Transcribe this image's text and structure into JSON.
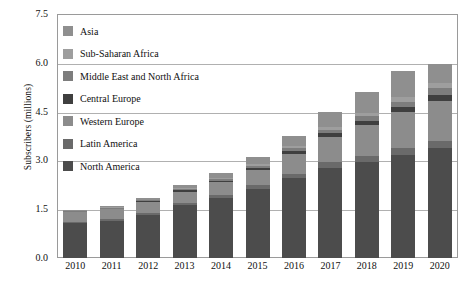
{
  "chart_data": {
    "type": "bar",
    "subtype": "stacked-bar",
    "title": "",
    "xlabel": "",
    "ylabel": "Subscribers (millions)",
    "ylim": [
      0.0,
      7.5
    ],
    "yticks": [
      "0.0",
      "1.5",
      "3.0",
      "4.5",
      "6.0",
      "7.5"
    ],
    "ytick_values": [
      0.0,
      1.5,
      3.0,
      4.5,
      6.0,
      7.5
    ],
    "grid": true,
    "grid_axis": "y",
    "legend_position": "upper-left-inside",
    "categories": [
      "2010",
      "2011",
      "2012",
      "2013",
      "2014",
      "2015",
      "2016",
      "2017",
      "2018",
      "2019",
      "2020"
    ],
    "series": [
      {
        "name": "North America",
        "color": "#4c4c4c",
        "values": [
          1.08,
          1.15,
          1.33,
          1.62,
          1.85,
          2.12,
          2.45,
          2.78,
          2.95,
          3.18,
          3.38
        ]
      },
      {
        "name": "Latin America",
        "color": "#6a6a6a",
        "values": [
          0.04,
          0.05,
          0.06,
          0.08,
          0.1,
          0.12,
          0.14,
          0.16,
          0.18,
          0.2,
          0.22
        ]
      },
      {
        "name": "Western Europe",
        "color": "#8c8c8c",
        "values": [
          0.28,
          0.3,
          0.32,
          0.34,
          0.38,
          0.46,
          0.6,
          0.78,
          0.95,
          1.1,
          1.24
        ]
      },
      {
        "name": "Central Europe",
        "color": "#3f3f3f",
        "values": [
          0.02,
          0.02,
          0.03,
          0.04,
          0.05,
          0.07,
          0.09,
          0.11,
          0.13,
          0.15,
          0.17
        ]
      },
      {
        "name": "Middle East and North Africa",
        "color": "#7d7d7d",
        "values": [
          0.02,
          0.02,
          0.03,
          0.04,
          0.05,
          0.07,
          0.09,
          0.12,
          0.15,
          0.18,
          0.21
        ]
      },
      {
        "name": "Sub-Saharan Africa",
        "color": "#9e9e9e",
        "values": [
          0.01,
          0.02,
          0.02,
          0.03,
          0.04,
          0.05,
          0.07,
          0.09,
          0.11,
          0.13,
          0.16
        ]
      },
      {
        "name": "Asia",
        "color": "#8f8f8f",
        "values": [
          0.03,
          0.04,
          0.06,
          0.09,
          0.13,
          0.21,
          0.31,
          0.46,
          0.63,
          0.81,
          0.57
        ]
      }
    ],
    "totals": [
      1.48,
      1.6,
      1.85,
      2.24,
      2.6,
      3.1,
      3.75,
      4.5,
      5.1,
      5.75,
      5.95
    ]
  },
  "legend": {
    "items": [
      {
        "label": "Asia",
        "color": "#8f8f8f"
      },
      {
        "label": "Sub-Saharan Africa",
        "color": "#9e9e9e"
      },
      {
        "label": "Middle East and North Africa",
        "color": "#7d7d7d"
      },
      {
        "label": "Central Europe",
        "color": "#3f3f3f"
      },
      {
        "label": "Western Europe",
        "color": "#8c8c8c"
      },
      {
        "label": "Latin America",
        "color": "#6a6a6a"
      },
      {
        "label": "North America",
        "color": "#4c4c4c"
      }
    ]
  },
  "axes": {
    "y_title": "Subscribers (millions)"
  },
  "colors": {
    "grid": "#b0b0b0",
    "frame": "#9a9a9a",
    "background": "#ffffff",
    "text": "#111111"
  }
}
